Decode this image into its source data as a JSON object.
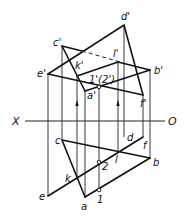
{
  "axis": {
    "left_label": "X",
    "right_label": "O"
  },
  "upper_labels": {
    "c": "c'",
    "d": "d'",
    "e": "e'",
    "f": "f'",
    "a": "a'",
    "b": "b'",
    "k": "k'",
    "l": "l'",
    "p12": "1'(2')"
  },
  "lower_labels": {
    "c": "c",
    "d": "d",
    "e": "e",
    "f": "f",
    "a": "a",
    "b": "b",
    "k": "k",
    "l": "l",
    "p1": "1",
    "p2": "2"
  },
  "colors": {
    "stroke": "#111111",
    "background": "#ffffff"
  }
}
